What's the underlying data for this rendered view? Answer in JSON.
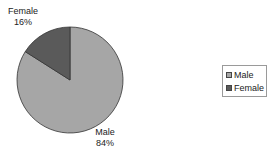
{
  "chart_data": {
    "type": "pie",
    "title": "",
    "categories": [
      "Male",
      "Female"
    ],
    "values": [
      84,
      16
    ],
    "unit": "%",
    "colors": [
      "#a6a6a6",
      "#5a5a5a"
    ],
    "data_labels": [
      {
        "name": "Male",
        "value": "84%"
      },
      {
        "name": "Female",
        "value": "16%"
      }
    ],
    "legend": {
      "position": "right",
      "entries": [
        "Male",
        "Female"
      ]
    }
  },
  "labels": {
    "female_name": "Female",
    "female_pct": "16%",
    "male_name": "Male",
    "male_pct": "84%"
  },
  "legend": {
    "items": [
      {
        "label": "Male",
        "color": "#a6a6a6"
      },
      {
        "label": "Female",
        "color": "#5a5a5a"
      }
    ]
  }
}
